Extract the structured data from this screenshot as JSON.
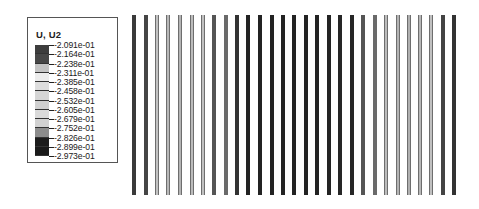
{
  "legend": {
    "title": "U, U2",
    "labels": [
      "-2.091e-01",
      "-2.164e-01",
      "-2.238e-01",
      "-2.311e-01",
      "-2.385e-01",
      "-2.458e-01",
      "-2.532e-01",
      "-2.605e-01",
      "-2.679e-01",
      "-2.752e-01",
      "-2.826e-01",
      "-2.899e-01",
      "-2.973e-01"
    ],
    "segment_colors": [
      "#3d3d3d",
      "#474747",
      "#c4c4c4",
      "#ececec",
      "#dedede",
      "#d6d6d6",
      "#d0d0d0",
      "#dadada",
      "#d2d2d2",
      "#8c8c8c",
      "#1c1c1c",
      "#1a1a1a"
    ]
  },
  "plot": {
    "bar_count": 29,
    "bars": [
      {
        "x": 132,
        "color": "#3a3a3a",
        "outlined": false
      },
      {
        "x": 144,
        "color": "#454545",
        "outlined": false
      },
      {
        "x": 155,
        "color": "#c2c2c2",
        "outlined": true
      },
      {
        "x": 166,
        "color": "#b8b8b8",
        "outlined": true
      },
      {
        "x": 178,
        "color": "#b4b4b4",
        "outlined": true
      },
      {
        "x": 190,
        "color": "#bcbcbc",
        "outlined": true
      },
      {
        "x": 201,
        "color": "#c0c0c0",
        "outlined": true
      },
      {
        "x": 212,
        "color": "#555555",
        "outlined": false
      },
      {
        "x": 224,
        "color": "#6a6a6a",
        "outlined": false
      },
      {
        "x": 235,
        "color": "#333333",
        "outlined": false
      },
      {
        "x": 246,
        "color": "#232323",
        "outlined": false
      },
      {
        "x": 258,
        "color": "#232323",
        "outlined": false
      },
      {
        "x": 270,
        "color": "#232323",
        "outlined": false
      },
      {
        "x": 281,
        "color": "#232323",
        "outlined": false
      },
      {
        "x": 292,
        "color": "#232323",
        "outlined": false
      },
      {
        "x": 304,
        "color": "#232323",
        "outlined": false
      },
      {
        "x": 315,
        "color": "#232323",
        "outlined": false
      },
      {
        "x": 327,
        "color": "#232323",
        "outlined": false
      },
      {
        "x": 338,
        "color": "#262626",
        "outlined": false
      },
      {
        "x": 350,
        "color": "#262626",
        "outlined": false
      },
      {
        "x": 361,
        "color": "#555555",
        "outlined": false
      },
      {
        "x": 373,
        "color": "#6a6a6a",
        "outlined": false
      },
      {
        "x": 384,
        "color": "#bcbcbc",
        "outlined": true
      },
      {
        "x": 396,
        "color": "#b4b4b4",
        "outlined": true
      },
      {
        "x": 407,
        "color": "#b0b0b0",
        "outlined": true
      },
      {
        "x": 418,
        "color": "#b8b8b8",
        "outlined": true
      },
      {
        "x": 429,
        "color": "#c0c0c0",
        "outlined": true
      },
      {
        "x": 441,
        "color": "#444444",
        "outlined": false
      },
      {
        "x": 452,
        "color": "#333333",
        "outlined": false
      }
    ]
  }
}
